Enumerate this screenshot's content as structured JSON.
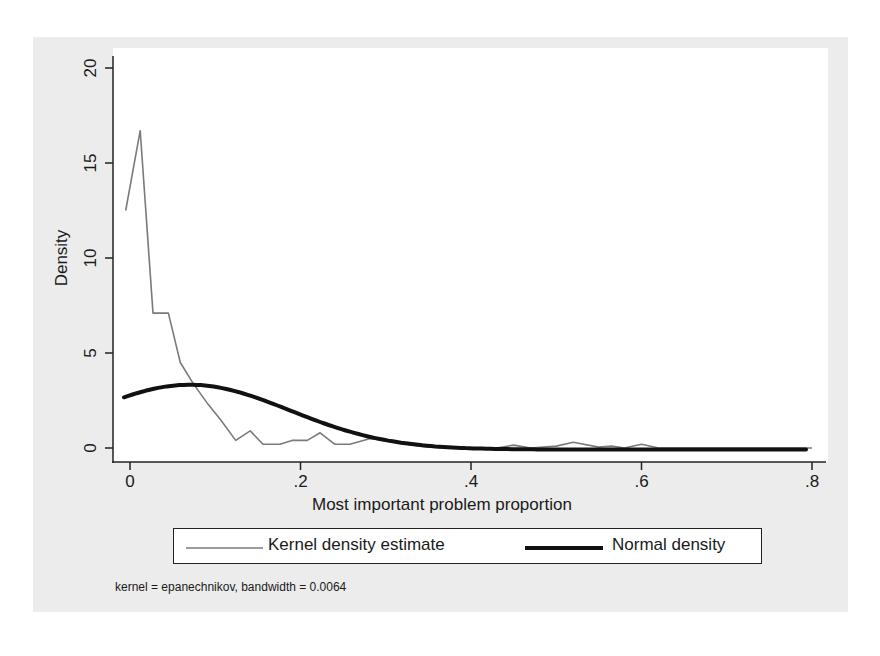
{
  "chart_data": {
    "type": "line",
    "title": "",
    "xlabel": "Most important problem proportion",
    "ylabel": "Density",
    "xlim": [
      -0.01,
      0.8
    ],
    "ylim": [
      0,
      20
    ],
    "xticks": [
      0,
      0.2,
      0.4,
      0.6,
      0.8
    ],
    "xtick_labels": [
      "0",
      ".2",
      ".4",
      ".6",
      ".8"
    ],
    "yticks": [
      0,
      5,
      10,
      15,
      20
    ],
    "ytick_labels": [
      "0",
      "5",
      "10",
      "15",
      "20"
    ],
    "grid": false,
    "legend_position": "bottom",
    "series": [
      {
        "name": "Kernel density estimate",
        "style": "thin gray line",
        "color": "#777777",
        "x": [
          -0.005,
          0.012,
          0.027,
          0.045,
          0.059,
          0.074,
          0.09,
          0.106,
          0.124,
          0.141,
          0.156,
          0.176,
          0.19,
          0.208,
          0.223,
          0.24,
          0.258,
          0.282,
          0.31,
          0.34,
          0.37,
          0.4,
          0.43,
          0.45,
          0.47,
          0.5,
          0.52,
          0.55,
          0.565,
          0.58,
          0.6,
          0.62,
          0.7,
          0.8
        ],
        "y": [
          12.5,
          16.7,
          7.1,
          7.1,
          4.5,
          3.4,
          2.4,
          1.5,
          0.4,
          0.9,
          0.2,
          0.2,
          0.4,
          0.4,
          0.8,
          0.2,
          0.2,
          0.5,
          0.3,
          0.1,
          0.0,
          0.0,
          0.0,
          0.15,
          0.0,
          0.1,
          0.3,
          0.05,
          0.1,
          0.0,
          0.2,
          0.0,
          0.0,
          0.0
        ]
      },
      {
        "name": "Normal density",
        "style": "thick black line",
        "color": "#111111",
        "mean": 0.07,
        "sd": 0.117,
        "x": [
          -0.007,
          0.0,
          0.05,
          0.07,
          0.1,
          0.15,
          0.2,
          0.25,
          0.3,
          0.35,
          0.4,
          0.5,
          0.6,
          0.7,
          0.8
        ],
        "y": [
          2.8,
          2.84,
          3.35,
          3.4,
          3.29,
          2.69,
          1.84,
          1.06,
          0.5,
          0.2,
          0.07,
          0.0,
          0.0,
          0.0,
          0.0
        ]
      }
    ],
    "annotations": [
      "kernel = epanechnikov, bandwidth = 0.0064"
    ]
  },
  "legend": {
    "items": [
      {
        "label": "Kernel density estimate"
      },
      {
        "label": "Normal density"
      }
    ]
  },
  "note": "kernel = epanechnikov, bandwidth = 0.0064",
  "axes": {
    "xlabel": "Most important problem proportion",
    "ylabel": "Density",
    "xtick_labels": [
      "0",
      ".2",
      ".4",
      ".6",
      ".8"
    ],
    "ytick_labels": [
      "0",
      "5",
      "10",
      "15",
      "20"
    ]
  }
}
